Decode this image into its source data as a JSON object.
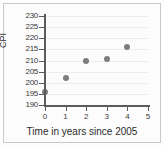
{
  "chart_data": {
    "type": "scatter",
    "title": "",
    "xlabel": "Time in years since 2005",
    "ylabel": "CPI",
    "xlim": [
      0,
      5
    ],
    "ylim": [
      190,
      230
    ],
    "xticks": [
      "0",
      "1",
      "2",
      "3",
      "4",
      "5"
    ],
    "yticks": [
      "190",
      "195",
      "200",
      "205",
      "210",
      "215",
      "220",
      "225",
      "230"
    ],
    "grid": true,
    "legend": "none",
    "marker_color": "#7d7d7d",
    "axis_color": "#5a5a5a",
    "x": [
      0,
      1,
      2,
      3,
      4
    ],
    "values": [
      196,
      202,
      210,
      210.5,
      216
    ],
    "points": [
      {
        "x": 0,
        "y": 196
      },
      {
        "x": 1,
        "y": 202
      },
      {
        "x": 2,
        "y": 210
      },
      {
        "x": 3,
        "y": 210.5
      },
      {
        "x": 4,
        "y": 216
      }
    ]
  }
}
